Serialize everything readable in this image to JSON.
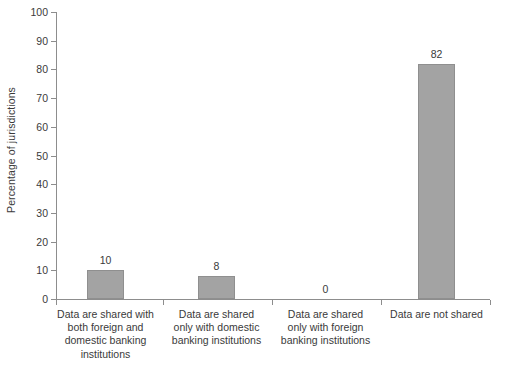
{
  "chart_data": {
    "type": "bar",
    "title": "",
    "subtitle": "",
    "xlabel": "",
    "ylabel": "Percentage of jurisdictions",
    "categories": [
      "Data are shared with both foreign and domestic banking institutions",
      "Data are shared only with domestic banking institutions",
      "Data are shared only with foreign banking institutions",
      "Data are not shared"
    ],
    "category_lines": [
      [
        "Data are shared with",
        "both foreign and",
        "domestic banking",
        "institutions"
      ],
      [
        "Data are shared",
        "only with domestic",
        "banking institutions"
      ],
      [
        "Data are shared",
        "only with foreign",
        "banking institutions"
      ],
      [
        "Data are not shared"
      ]
    ],
    "values": [
      10,
      8,
      0,
      82
    ],
    "value_labels": [
      "10",
      "8",
      "0",
      "82"
    ],
    "ylim": [
      0,
      100
    ],
    "ytick_labels": [
      "0",
      "10",
      "20",
      "30",
      "40",
      "50",
      "60",
      "70",
      "80",
      "90",
      "100"
    ],
    "ytick_values": [
      0,
      10,
      20,
      30,
      40,
      50,
      60,
      70,
      80,
      90,
      100
    ],
    "grid": false,
    "legend": false,
    "legend_position": "none",
    "bar_color": "#a3a3a3",
    "bar_edge_color": "#8f8f8f",
    "axis_color": "#8d8d8d",
    "text_color": "#3a3a3a",
    "background_color": "#ffffff"
  },
  "geometry": {
    "plot_left": 56,
    "plot_right": 490,
    "baseline_y": 299,
    "top_y": 12,
    "bar_width": 37,
    "bar_centers": [
      105.5,
      216.5,
      325.5,
      436.5
    ],
    "xtick_positions": [
      56,
      163,
      272,
      381,
      490
    ]
  }
}
